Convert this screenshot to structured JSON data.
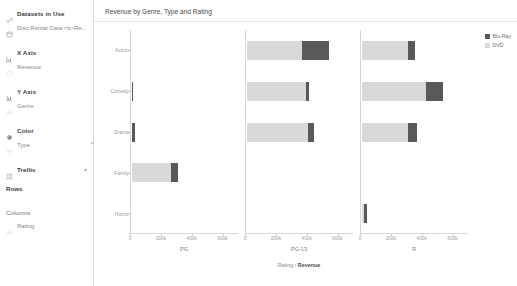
{
  "sidebar": {
    "datasets_header": "Datasets in Use",
    "dataset_name": "Disc Rental Data <b>Re...",
    "sections": [
      {
        "header": "X Axis",
        "value": "Revenue"
      },
      {
        "header": "Y Axis",
        "value": "Genre"
      },
      {
        "header": "Color",
        "value": "Type"
      }
    ],
    "trellis_header": "Trellis",
    "rows_label": "Rows",
    "rows_value": "",
    "columns_label": "Columns",
    "columns_value": "Rating"
  },
  "header": {
    "title": "Revenue by Genre, Type and Rating"
  },
  "legend": {
    "items": [
      {
        "label": "Blu-Ray",
        "color": "#595959"
      },
      {
        "label": "DVD",
        "color": "#d9d9d9"
      }
    ]
  },
  "chart_data": {
    "type": "bar",
    "orientation": "horizontal",
    "stacked": true,
    "title": "Revenue by Genre, Type and Rating",
    "xlabel": "Rating / Revenue",
    "ylabel": "Genre",
    "xlim": [
      0,
      700000
    ],
    "xticks": [
      0,
      200000,
      400000,
      600000
    ],
    "xtick_labels": [
      "0",
      "200k",
      "400k",
      "600k"
    ],
    "grid": false,
    "legend_position": "right",
    "categories": [
      "Action",
      "Comedy",
      "Drama",
      "Family",
      "Horror"
    ],
    "trellis_columns": [
      "PG",
      "PG-13",
      "R"
    ],
    "series": [
      {
        "name": "DVD",
        "color": "#d9d9d9"
      },
      {
        "name": "Blu-Ray",
        "color": "#595959"
      }
    ],
    "panels": [
      {
        "rating": "PG",
        "bars": [
          {
            "genre": "Action",
            "DVD": 0,
            "Blu-Ray": 0
          },
          {
            "genre": "Comedy",
            "DVD": 0,
            "Blu-Ray": 6000
          },
          {
            "genre": "Drama",
            "DVD": 0,
            "Blu-Ray": 22000
          },
          {
            "genre": "Family",
            "DVD": 252000,
            "Blu-Ray": 48000
          },
          {
            "genre": "Horror",
            "DVD": 0,
            "Blu-Ray": 0
          }
        ]
      },
      {
        "rating": "PG-13",
        "bars": [
          {
            "genre": "Action",
            "DVD": 356000,
            "Blu-Ray": 178000
          },
          {
            "genre": "Comedy",
            "DVD": 380000,
            "Blu-Ray": 22000
          },
          {
            "genre": "Drama",
            "DVD": 398000,
            "Blu-Ray": 36000
          },
          {
            "genre": "Family",
            "DVD": 0,
            "Blu-Ray": 0
          },
          {
            "genre": "Horror",
            "DVD": 0,
            "Blu-Ray": 0
          }
        ]
      },
      {
        "rating": "R",
        "bars": [
          {
            "genre": "Action",
            "DVD": 296000,
            "Blu-Ray": 50000
          },
          {
            "genre": "Comedy",
            "DVD": 412000,
            "Blu-Ray": 116000
          },
          {
            "genre": "Drama",
            "DVD": 298000,
            "Blu-Ray": 56000
          },
          {
            "genre": "Family",
            "DVD": 0,
            "Blu-Ray": 0
          },
          {
            "genre": "Horror",
            "DVD": 14000,
            "Blu-Ray": 18000
          }
        ]
      }
    ]
  }
}
